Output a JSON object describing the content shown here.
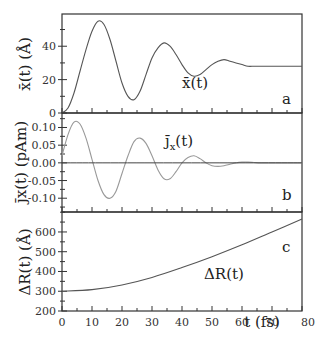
{
  "chart_data": [
    {
      "type": "line",
      "panel": "a",
      "title": "",
      "series": [
        {
          "name": "x̄(t)",
          "x": [
            0,
            2,
            4,
            6,
            8,
            10,
            12,
            14,
            16,
            18,
            20,
            22,
            24,
            26,
            28,
            30,
            32,
            34,
            36,
            38,
            40,
            42,
            44,
            46,
            48,
            50,
            52,
            54,
            56,
            58,
            60,
            62,
            64,
            66,
            68,
            70,
            72,
            74,
            76,
            78,
            80
          ],
          "values": [
            0,
            3,
            12,
            25,
            38,
            49,
            55,
            53,
            44,
            31,
            18,
            10,
            8,
            13,
            23,
            33,
            39,
            42,
            40,
            35,
            29,
            24,
            22,
            23,
            26,
            29,
            31,
            32,
            31,
            30,
            29,
            28,
            28,
            28,
            28,
            28,
            28,
            28,
            28,
            28,
            28
          ]
        }
      ],
      "xlabel": "",
      "ylabel": "x̄(t) (Å)",
      "yticks": [
        "0",
        "20",
        "40"
      ],
      "ylim": [
        0,
        59
      ],
      "xlim": [
        0,
        80
      ],
      "annotation": "x̄(t)",
      "letter": "a"
    },
    {
      "type": "line",
      "panel": "b",
      "series": [
        {
          "name": "j̄x(t)",
          "x": [
            0,
            2,
            4,
            6,
            8,
            10,
            12,
            14,
            16,
            18,
            20,
            22,
            24,
            26,
            28,
            30,
            32,
            34,
            36,
            38,
            40,
            42,
            44,
            46,
            48,
            50,
            52,
            54,
            56,
            58,
            60,
            62,
            64,
            66,
            68,
            70,
            72,
            74,
            76,
            78,
            80
          ],
          "values": [
            0.02,
            0.08,
            0.115,
            0.11,
            0.07,
            0.01,
            -0.05,
            -0.09,
            -0.1,
            -0.08,
            -0.03,
            0.02,
            0.06,
            0.07,
            0.055,
            0.02,
            -0.02,
            -0.045,
            -0.045,
            -0.025,
            0.0,
            0.015,
            0.02,
            0.012,
            0.0,
            -0.008,
            -0.01,
            -0.008,
            -0.004,
            0.0,
            0.002,
            0.002,
            0.001,
            0,
            0,
            0,
            0,
            0,
            0,
            0,
            0
          ]
        },
        {
          "name": "zero line",
          "x": [
            0,
            80
          ],
          "values": [
            0,
            0
          ]
        }
      ],
      "ylabel": "j̄x(t) (pAm)",
      "yticks": [
        "0.10",
        "0.05",
        "0.00",
        "-0.05",
        "-0.10"
      ],
      "ylim": [
        -0.14,
        0.14
      ],
      "xlim": [
        0,
        80
      ],
      "annotation": "j̄x(t)",
      "letter": "b"
    },
    {
      "type": "line",
      "panel": "c",
      "series": [
        {
          "name": "ΔR(t)",
          "x": [
            0,
            10,
            20,
            30,
            40,
            50,
            60,
            70,
            80
          ],
          "values": [
            300,
            308,
            332,
            370,
            420,
            475,
            535,
            600,
            665
          ]
        }
      ],
      "xlabel": "t (fs)",
      "ylabel": "ΔR(t) (Å)",
      "yticks": [
        "200",
        "300",
        "400",
        "500",
        "600"
      ],
      "xticks": [
        "0",
        "10",
        "20",
        "30",
        "40",
        "50",
        "60",
        "70",
        "80"
      ],
      "ylim": [
        200,
        700
      ],
      "xlim": [
        0,
        80
      ],
      "annotation": "ΔR(t)",
      "letter": "c"
    }
  ],
  "labels": {
    "a_ylabel": "x̄(t) (Å)",
    "a_curve": "x̄(t)",
    "a_letter": "a",
    "b_ylabel": "j̄x(t) (pAm)",
    "b_curve": "j̄",
    "b_curve_sub": "x",
    "b_curve_tail": "(t)",
    "b_letter": "b",
    "c_ylabel": "ΔR(t) (Å)",
    "c_curve": "ΔR(t)",
    "c_letter": "c",
    "xlabel": "t (fs)"
  },
  "ticks": {
    "a": [
      "0",
      "20",
      "40"
    ],
    "b": [
      "0.10",
      "0.05",
      "0.00",
      "-0.05",
      "-0.10"
    ],
    "c": [
      "200",
      "300",
      "400",
      "500",
      "600"
    ],
    "x": [
      "0",
      "10",
      "20",
      "30",
      "40",
      "50",
      "60",
      "70"
    ],
    "x_last": "80"
  },
  "colors": {
    "line": "#555555",
    "axis": "#333333"
  }
}
